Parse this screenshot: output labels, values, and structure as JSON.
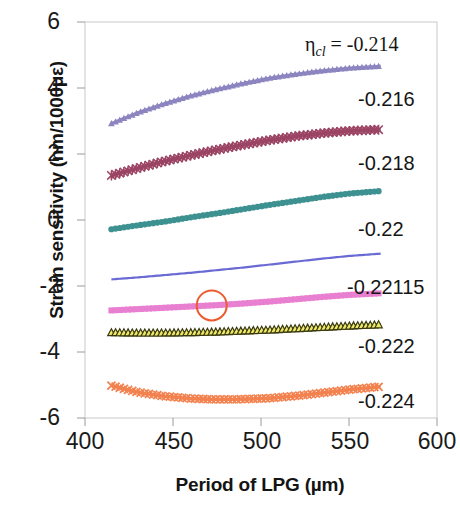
{
  "chart_data": {
    "type": "line",
    "title": "",
    "xlabel": "Period of LPG (µm)",
    "ylabel": "Strain sensitivity (nm/1000με)",
    "xlim": [
      400,
      600
    ],
    "ylim": [
      -6,
      6
    ],
    "xticks": [
      400,
      450,
      500,
      550,
      600
    ],
    "yticks": [
      6,
      4,
      2,
      0,
      -2,
      -4,
      -6
    ],
    "xtick_labels": [
      "400",
      "450",
      "500",
      "550",
      "600"
    ],
    "ytick_labels": [
      "6",
      "4",
      "2",
      "0",
      "-2",
      "-4",
      "-6"
    ],
    "grid": false,
    "legend_position": "inline-right-annotations",
    "parameter_symbol": "η",
    "parameter_subscript": "cl",
    "parameter_equals": "=",
    "x_data_range": [
      415,
      568
    ],
    "series": [
      {
        "name": "-0.214",
        "label": "-0.214",
        "color": "#8c85c0",
        "marker": "triangle",
        "x": [
          415,
          430,
          445,
          460,
          475,
          490,
          505,
          520,
          535,
          550,
          568
        ],
        "values": [
          2.92,
          3.25,
          3.52,
          3.76,
          3.96,
          4.14,
          4.3,
          4.42,
          4.52,
          4.6,
          4.66
        ]
      },
      {
        "name": "-0.216",
        "label": "-0.216",
        "color": "#9b4464",
        "marker": "star",
        "x": [
          415,
          430,
          445,
          460,
          475,
          490,
          505,
          520,
          535,
          550,
          568
        ],
        "values": [
          1.35,
          1.57,
          1.78,
          1.96,
          2.13,
          2.28,
          2.42,
          2.54,
          2.63,
          2.7,
          2.74
        ]
      },
      {
        "name": "-0.218",
        "label": "-0.218",
        "color": "#3d9190",
        "marker": "circle",
        "x": [
          415,
          430,
          445,
          460,
          475,
          490,
          505,
          520,
          535,
          550,
          568
        ],
        "values": [
          -0.28,
          -0.16,
          -0.05,
          0.08,
          0.2,
          0.33,
          0.46,
          0.58,
          0.7,
          0.8,
          0.88
        ]
      },
      {
        "name": "-0.22",
        "label": "-0.22",
        "color": "#6a6ad4",
        "marker": "none",
        "x": [
          415,
          430,
          445,
          460,
          475,
          490,
          505,
          520,
          535,
          550,
          568
        ],
        "values": [
          -1.8,
          -1.74,
          -1.67,
          -1.6,
          -1.52,
          -1.44,
          -1.35,
          -1.26,
          -1.17,
          -1.09,
          -1.02
        ]
      },
      {
        "name": "-0.22115",
        "label": "-0.22115",
        "color": "#e87fd0",
        "marker": "square",
        "x": [
          415,
          430,
          445,
          460,
          475,
          490,
          505,
          520,
          535,
          550,
          568
        ],
        "values": [
          -2.74,
          -2.7,
          -2.66,
          -2.62,
          -2.58,
          -2.53,
          -2.47,
          -2.4,
          -2.33,
          -2.27,
          -2.22
        ]
      },
      {
        "name": "-0.222",
        "label": "-0.222",
        "color": "#3a3a10",
        "fill": "#efe96a",
        "marker": "triangle-open",
        "x": [
          415,
          430,
          445,
          460,
          475,
          490,
          505,
          520,
          535,
          550,
          568
        ],
        "values": [
          -3.42,
          -3.43,
          -3.43,
          -3.42,
          -3.4,
          -3.37,
          -3.34,
          -3.3,
          -3.26,
          -3.22,
          -3.18
        ]
      },
      {
        "name": "-0.224",
        "label": "-0.224",
        "color": "#f2824f",
        "marker": "x",
        "x": [
          415,
          430,
          445,
          460,
          475,
          490,
          505,
          520,
          535,
          550,
          568
        ],
        "values": [
          -5.02,
          -5.22,
          -5.34,
          -5.41,
          -5.44,
          -5.43,
          -5.4,
          -5.33,
          -5.24,
          -5.14,
          -5.05
        ]
      }
    ],
    "annotations": [
      {
        "name": "highlight-circle",
        "shape": "circle",
        "color": "#ec5b2e",
        "x": 472,
        "y": -2.59,
        "radius_px": 15
      }
    ]
  },
  "axis": {
    "eta_text": "η",
    "eta_sub": "cl",
    "eta_eq": "= -0.214"
  },
  "series_labels": {
    "s0": "-0.216",
    "s1": "-0.218",
    "s2": "-0.22",
    "s3": "-0.22115",
    "s4": "-0.222",
    "s5": "-0.224"
  },
  "ytick_texts": {
    "t0": "6",
    "t1": "4",
    "t2": "2",
    "t3": "0",
    "t4": "-2",
    "t5": "-4",
    "t6": "-6"
  },
  "xtick_texts": {
    "t0": "400",
    "t1": "450",
    "t2": "500",
    "t3": "550",
    "t4": "600"
  },
  "labels": {
    "xaxis_title": "Period of LPG (µm)",
    "yaxis_title": "Strain sensitivity (nm/1000με)"
  }
}
